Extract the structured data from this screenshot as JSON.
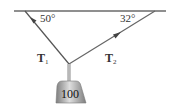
{
  "diagram": {
    "angles": {
      "left": "50°",
      "right": "32°"
    },
    "tensions": {
      "left": {
        "symbol": "T",
        "subscript": "1"
      },
      "right": {
        "symbol": "T",
        "subscript": "2"
      }
    },
    "weight": {
      "label": "100"
    },
    "colors": {
      "line": "#555555",
      "ceiling": "#666666",
      "weight_light": "#d8d8d8",
      "weight_dark": "#8a8a8a",
      "text": "#333333"
    }
  }
}
